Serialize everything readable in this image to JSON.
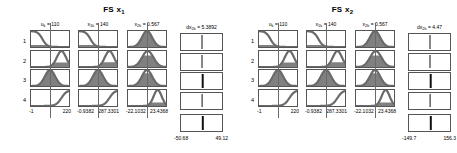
{
  "figure": {
    "type": "fuzzy-rule-viewer",
    "background_color": "#ffffff",
    "line_color": "#6a6a6a",
    "fill_color": "#808080",
    "bar_color": "#111111"
  },
  "panels": [
    {
      "id": "fs-x1",
      "title": "FS x",
      "title_sub": "1",
      "variables": [
        {
          "name": "u",
          "name_sub": "k",
          "value_label": "= 110",
          "header": "uₖ = 110",
          "axis_min": "-1",
          "axis_max": "220",
          "input_fraction": 0.5,
          "memberships": [
            {
              "rule": 1,
              "shape": "z",
              "fill_to": 0.5,
              "alpha": 0.13
            },
            {
              "rule": 2,
              "shape": "s-right-bell",
              "fill_to": 1.0,
              "alpha": 0.28
            },
            {
              "rule": 3,
              "shape": "gauss-center",
              "fill_to": 1.0,
              "alpha": 0.95
            },
            {
              "rule": 4,
              "shape": "s-up",
              "fill_to": 0.0,
              "alpha": 0.02
            }
          ]
        },
        {
          "name": "x",
          "name_sub": "1k",
          "value_label": "= 140",
          "header": "x₁ₖ = 140",
          "axis_min": "-0.9382",
          "axis_max": "287.3301",
          "input_fraction": 0.49,
          "memberships": [
            {
              "rule": 1,
              "shape": "z",
              "fill_to": 0.49,
              "alpha": 0.12
            },
            {
              "rule": 2,
              "shape": "s-right-bell",
              "fill_to": 1.0,
              "alpha": 0.3
            },
            {
              "rule": 3,
              "shape": "gauss-center",
              "fill_to": 1.0,
              "alpha": 0.92
            },
            {
              "rule": 4,
              "shape": "s-up",
              "fill_to": 0.0,
              "alpha": 0.03
            }
          ]
        },
        {
          "name": "x",
          "name_sub": "2k",
          "value_label": "= 0.567",
          "header": "x₂ₖ = 0.567",
          "axis_min": "-22.1032",
          "axis_max": "23.4368",
          "input_fraction": 0.5,
          "memberships": [
            {
              "rule": 1,
              "shape": "gauss-center",
              "fill_to": 1.0,
              "alpha": 0.95
            },
            {
              "rule": 2,
              "shape": "gauss-clip",
              "fill_to": 1.0,
              "alpha": 0.72
            },
            {
              "rule": 3,
              "shape": "gauss-center",
              "fill_to": 1.0,
              "alpha": 0.8
            },
            {
              "rule": 4,
              "shape": "gauss-right-low",
              "fill_to": 1.0,
              "alpha": 0.22
            }
          ]
        }
      ],
      "output": {
        "name": "dx",
        "name_sub": "2k",
        "value_label": "= 5.3892",
        "header": "dx₂ₖ = 5.3892",
        "axis_min": "-50.68",
        "axis_max": "49.12",
        "rule_bars": [
          {
            "rule": 1,
            "position": 0.52,
            "width": 1.0
          },
          {
            "rule": 2,
            "position": 0.5,
            "width": 1.0
          },
          {
            "rule": 3,
            "position": 0.53,
            "width": 2.6
          },
          {
            "rule": 4,
            "position": 0.51,
            "width": 0.8
          }
        ],
        "aggregate_bar": {
          "position": 0.53,
          "width": 2.4
        }
      }
    },
    {
      "id": "fs-x2",
      "title": "FS x",
      "title_sub": "2",
      "variables": [
        {
          "name": "u",
          "name_sub": "k",
          "value_label": "= 110",
          "header": "uₖ = 110",
          "axis_min": "-1",
          "axis_max": "220",
          "input_fraction": 0.5,
          "memberships": [
            {
              "rule": 1,
              "shape": "z",
              "fill_to": 0.5,
              "alpha": 0.13
            },
            {
              "rule": 2,
              "shape": "s-right-bell",
              "fill_to": 1.0,
              "alpha": 0.28
            },
            {
              "rule": 3,
              "shape": "gauss-center",
              "fill_to": 1.0,
              "alpha": 0.95
            },
            {
              "rule": 4,
              "shape": "s-up",
              "fill_to": 0.0,
              "alpha": 0.02
            }
          ]
        },
        {
          "name": "x",
          "name_sub": "1k",
          "value_label": "= 140",
          "header": "x₁ₖ = 140",
          "axis_min": "-0.9382",
          "axis_max": "287.3301",
          "input_fraction": 0.49,
          "memberships": [
            {
              "rule": 1,
              "shape": "z",
              "fill_to": 0.49,
              "alpha": 0.12
            },
            {
              "rule": 2,
              "shape": "s-right-bell",
              "fill_to": 1.0,
              "alpha": 0.3
            },
            {
              "rule": 3,
              "shape": "gauss-center",
              "fill_to": 1.0,
              "alpha": 0.92
            },
            {
              "rule": 4,
              "shape": "s-up",
              "fill_to": 0.0,
              "alpha": 0.03
            }
          ]
        },
        {
          "name": "x",
          "name_sub": "2k",
          "value_label": "= 0.567",
          "header": "x₂ₖ = 0.567",
          "axis_min": "-22.1032",
          "axis_max": "23.4368",
          "input_fraction": 0.5,
          "memberships": [
            {
              "rule": 1,
              "shape": "gauss-center",
              "fill_to": 1.0,
              "alpha": 0.95
            },
            {
              "rule": 2,
              "shape": "gauss-clip",
              "fill_to": 1.0,
              "alpha": 0.72
            },
            {
              "rule": 3,
              "shape": "gauss-center",
              "fill_to": 1.0,
              "alpha": 0.8
            },
            {
              "rule": 4,
              "shape": "gauss-right-low",
              "fill_to": 1.0,
              "alpha": 0.22
            }
          ]
        }
      ],
      "output": {
        "name": "dx",
        "name_sub": "2k",
        "value_label": "= 4.47",
        "header": "dx₂ₖ = 4.47",
        "axis_min": "-149.7",
        "axis_max": "156.3",
        "rule_bars": [
          {
            "rule": 1,
            "position": 0.52,
            "width": 1.0
          },
          {
            "rule": 2,
            "position": 0.5,
            "width": 1.0
          },
          {
            "rule": 3,
            "position": 0.53,
            "width": 2.6
          },
          {
            "rule": 4,
            "position": 0.51,
            "width": 0.8
          }
        ],
        "aggregate_bar": {
          "position": 0.53,
          "width": 2.4
        }
      }
    }
  ],
  "rule_numbers": [
    "1",
    "2",
    "3",
    "4"
  ]
}
